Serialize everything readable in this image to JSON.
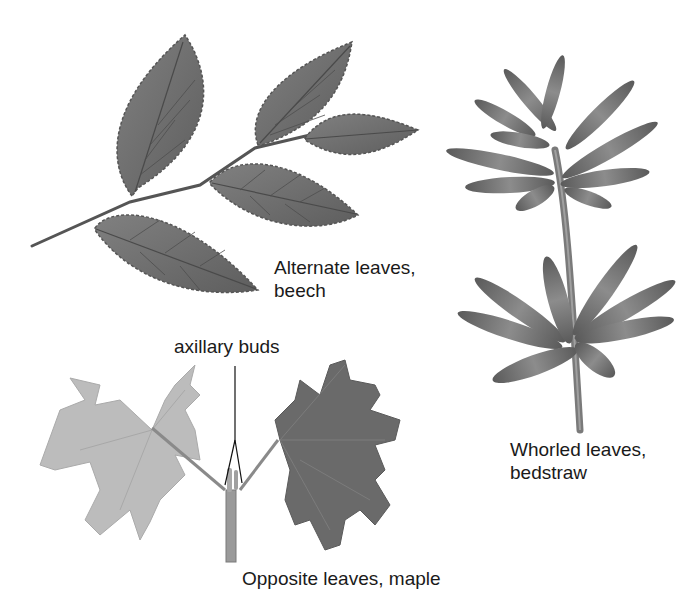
{
  "figure": {
    "panels": [
      {
        "id": "alternate",
        "caption_line1": "Alternate leaves,",
        "caption_line2": "beech",
        "arrangement": "alternate",
        "plant": "beech"
      },
      {
        "id": "whorled",
        "caption_line1": "Whorled leaves,",
        "caption_line2": "bedstraw",
        "arrangement": "whorled",
        "plant": "bedstraw"
      },
      {
        "id": "opposite",
        "caption_line1": "Opposite leaves, maple",
        "arrangement": "opposite",
        "plant": "maple"
      }
    ],
    "annotations": {
      "axillary_buds": "axillary buds"
    },
    "colors": {
      "background": "#ffffff",
      "beech_leaf": "#6e6e6e",
      "beech_vein": "#4a4a4a",
      "bedstraw_leaf": "#707070",
      "maple_light": "#b8b8b8",
      "maple_dark": "#6a6a6a",
      "stem": "#8a8a8a",
      "text": "#1a1a1a"
    }
  }
}
